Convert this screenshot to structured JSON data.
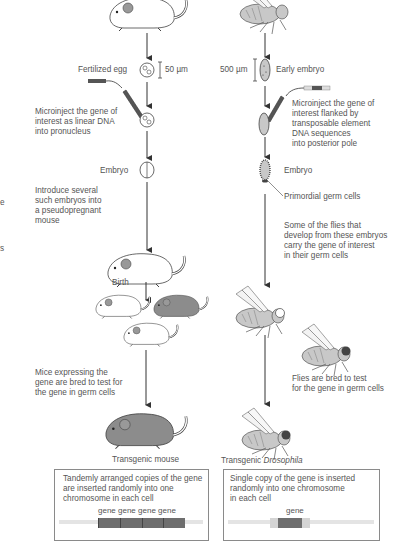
{
  "mouse_path": {
    "fertilized_egg_label": "Fertilized egg",
    "egg_scale": "50 µm",
    "microinject_text": [
      "Microinject the gene of",
      "interest as linear DNA",
      "into pronucleus"
    ],
    "embryo_label": "Embryo",
    "introduce_text": [
      "Introduce several",
      "such embryos into",
      "a pseudopregnant",
      "mouse"
    ],
    "birth_label": "Birth",
    "bred_text": [
      "Mice expressing the",
      "gene are bred to test for",
      "the gene in germ cells"
    ],
    "final_label": "Transgenic mouse",
    "box_text": [
      "Tandemly arranged copies of the gene",
      "are inserted randomly into one",
      "chromosome in each cell"
    ],
    "gene_labels": "gene gene gene gene"
  },
  "fly_path": {
    "embryo_scale": "500 µm",
    "early_embryo_label": "Early embryo",
    "microinject_text": [
      "Microinject the gene of",
      "interest flanked by",
      "transposable element",
      "DNA sequences",
      "into posterior pole"
    ],
    "embryo_label": "Embryo",
    "germ_cells_label": "Primordial germ cells",
    "develop_text": [
      "Some of the flies that",
      "develop from these embryos",
      "carry the gene of interest",
      "in their germ cells"
    ],
    "bred_text": [
      "Flies are bred to test",
      "for the gene in germ cells"
    ],
    "final_label_prefix": "Transgenic ",
    "final_label_species": "Drosophila",
    "box_text": [
      "Single copy of the gene is inserted",
      "randomly into one chromosome",
      "in each cell"
    ],
    "gene_label": "gene"
  },
  "left_edge_fragments": [
    "e",
    "s"
  ],
  "colors": {
    "line": "#3a3a3a",
    "text": "#555555",
    "mouse_white": "#ffffff",
    "mouse_dark": "#8c8c8c",
    "fly_body": "#c8c8c8",
    "gene_dark": "#6e6e6e",
    "gene_light": "#d4d4d4"
  }
}
